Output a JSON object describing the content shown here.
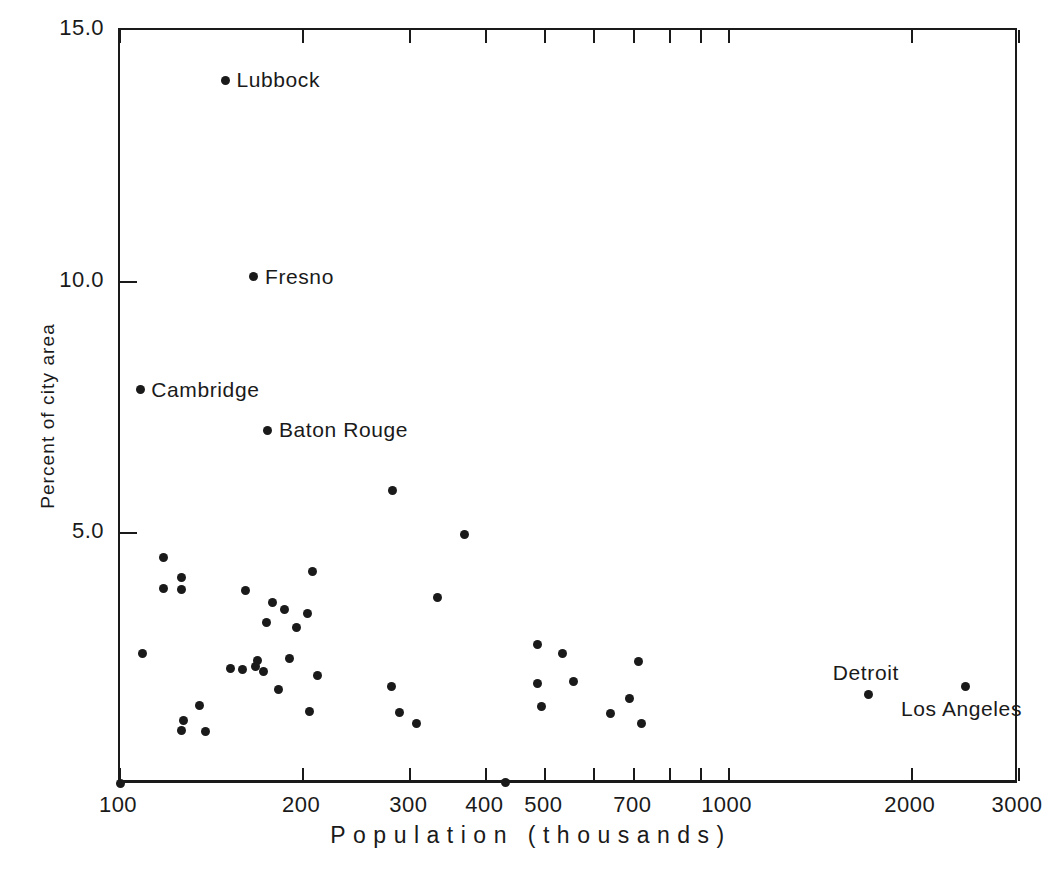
{
  "chart_data": {
    "type": "scatter",
    "title": "",
    "xlabel": "P o p u l a t i o n   ( t h o u s a n d s )",
    "xlabel_plain": "Population (thousands)",
    "ylabel": "Percent of city area",
    "xscale": "log",
    "yscale": "linear",
    "xlim": [
      100,
      3000
    ],
    "ylim": [
      0,
      15
    ],
    "grid": false,
    "legend": null,
    "xticks": [
      {
        "value": 100,
        "label": "100",
        "labeled": true
      },
      {
        "value": 200,
        "label": "200",
        "labeled": true
      },
      {
        "value": 300,
        "label": "300",
        "labeled": true
      },
      {
        "value": 400,
        "label": "400",
        "labeled": true
      },
      {
        "value": 500,
        "label": "500",
        "labeled": true
      },
      {
        "value": 600,
        "label": "",
        "labeled": false
      },
      {
        "value": 700,
        "label": "700",
        "labeled": true
      },
      {
        "value": 800,
        "label": "",
        "labeled": false
      },
      {
        "value": 900,
        "label": "",
        "labeled": false
      },
      {
        "value": 1000,
        "label": "1000",
        "labeled": true
      },
      {
        "value": 2000,
        "label": "2000",
        "labeled": true
      },
      {
        "value": 3000,
        "label": "3000",
        "labeled": true
      }
    ],
    "yticks": [
      {
        "value": 15.0,
        "label": "15.0"
      },
      {
        "value": 10.0,
        "label": "10.0"
      },
      {
        "value": 5.0,
        "label": "5.0"
      }
    ],
    "points": [
      {
        "x": 149,
        "y": 14.0,
        "label": "Lubbock",
        "label_pos": "right"
      },
      {
        "x": 166,
        "y": 10.1,
        "label": "Fresno",
        "label_pos": "right"
      },
      {
        "x": 108,
        "y": 7.85,
        "label": "Cambridge",
        "label_pos": "right"
      },
      {
        "x": 175,
        "y": 7.05,
        "label": "Baton Rouge",
        "label_pos": "right"
      },
      {
        "x": 1700,
        "y": 1.8,
        "label": "Detroit",
        "label_pos": "above"
      },
      {
        "x": 2450,
        "y": 1.95,
        "label": "Los Angeles",
        "label_pos": "below"
      },
      {
        "x": 280,
        "y": 5.85,
        "label": "",
        "label_pos": ""
      },
      {
        "x": 368,
        "y": 4.97,
        "label": "",
        "label_pos": ""
      },
      {
        "x": 118,
        "y": 4.52,
        "label": "",
        "label_pos": ""
      },
      {
        "x": 207,
        "y": 4.25,
        "label": "",
        "label_pos": ""
      },
      {
        "x": 126,
        "y": 4.12,
        "label": "",
        "label_pos": ""
      },
      {
        "x": 118,
        "y": 3.9,
        "label": "",
        "label_pos": ""
      },
      {
        "x": 126,
        "y": 3.88,
        "label": "",
        "label_pos": ""
      },
      {
        "x": 161,
        "y": 3.87,
        "label": "",
        "label_pos": ""
      },
      {
        "x": 333,
        "y": 3.72,
        "label": "",
        "label_pos": ""
      },
      {
        "x": 178,
        "y": 3.62,
        "label": "",
        "label_pos": ""
      },
      {
        "x": 186,
        "y": 3.48,
        "label": "",
        "label_pos": ""
      },
      {
        "x": 203,
        "y": 3.4,
        "label": "",
        "label_pos": ""
      },
      {
        "x": 174,
        "y": 3.22,
        "label": "",
        "label_pos": ""
      },
      {
        "x": 195,
        "y": 3.12,
        "label": "",
        "label_pos": ""
      },
      {
        "x": 109,
        "y": 2.62,
        "label": "",
        "label_pos": ""
      },
      {
        "x": 486,
        "y": 2.8,
        "label": "",
        "label_pos": ""
      },
      {
        "x": 534,
        "y": 2.62,
        "label": "",
        "label_pos": ""
      },
      {
        "x": 168,
        "y": 2.47,
        "label": "",
        "label_pos": ""
      },
      {
        "x": 190,
        "y": 2.52,
        "label": "",
        "label_pos": ""
      },
      {
        "x": 167,
        "y": 2.35,
        "label": "",
        "label_pos": ""
      },
      {
        "x": 152,
        "y": 2.32,
        "label": "",
        "label_pos": ""
      },
      {
        "x": 159,
        "y": 2.3,
        "label": "",
        "label_pos": ""
      },
      {
        "x": 172,
        "y": 2.25,
        "label": "",
        "label_pos": ""
      },
      {
        "x": 712,
        "y": 2.45,
        "label": "",
        "label_pos": ""
      },
      {
        "x": 211,
        "y": 2.18,
        "label": "",
        "label_pos": ""
      },
      {
        "x": 485,
        "y": 2.02,
        "label": "",
        "label_pos": ""
      },
      {
        "x": 556,
        "y": 2.05,
        "label": "",
        "label_pos": ""
      },
      {
        "x": 279,
        "y": 1.95,
        "label": "",
        "label_pos": ""
      },
      {
        "x": 182,
        "y": 1.9,
        "label": "",
        "label_pos": ""
      },
      {
        "x": 686,
        "y": 1.72,
        "label": "",
        "label_pos": ""
      },
      {
        "x": 135,
        "y": 1.57,
        "label": "",
        "label_pos": ""
      },
      {
        "x": 493,
        "y": 1.55,
        "label": "",
        "label_pos": ""
      },
      {
        "x": 205,
        "y": 1.47,
        "label": "",
        "label_pos": ""
      },
      {
        "x": 288,
        "y": 1.45,
        "label": "",
        "label_pos": ""
      },
      {
        "x": 640,
        "y": 1.42,
        "label": "",
        "label_pos": ""
      },
      {
        "x": 127,
        "y": 1.28,
        "label": "",
        "label_pos": ""
      },
      {
        "x": 307,
        "y": 1.22,
        "label": "",
        "label_pos": ""
      },
      {
        "x": 718,
        "y": 1.22,
        "label": "",
        "label_pos": ""
      },
      {
        "x": 126,
        "y": 1.08,
        "label": "",
        "label_pos": ""
      },
      {
        "x": 138,
        "y": 1.07,
        "label": "",
        "label_pos": ""
      },
      {
        "x": 430,
        "y": 0.05,
        "label": "",
        "label_pos": ""
      },
      {
        "x": 100,
        "y": 0.03,
        "label": "",
        "label_pos": ""
      }
    ]
  }
}
